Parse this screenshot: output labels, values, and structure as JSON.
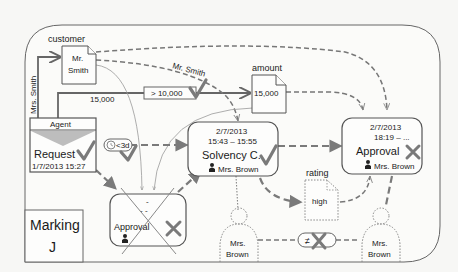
{
  "diagram": {
    "title_marking": "Marking",
    "marking_value": "J",
    "colors": {
      "stroke": "#555555",
      "mark": "#7a7a7a",
      "background": "#f7f7f5"
    },
    "data_objects": {
      "customer": {
        "label": "customer",
        "value_line1": "Mr.",
        "value_line2": "Smith"
      },
      "amount": {
        "label": "amount",
        "value": "15,000"
      },
      "rating": {
        "label": "rating",
        "value": "high"
      }
    },
    "edge_labels": {
      "mrs_smith": "Mrs. Smith",
      "mr_smith": "Mr. Smith",
      "amount_15000": "15,000",
      "condition": "> 10,000",
      "timer": "<3d"
    },
    "activities": {
      "request": {
        "role": "Agent",
        "name": "Request",
        "timestamp": "1/7/2013 15:27",
        "status": "check"
      },
      "solvency": {
        "date": "2/7/2013",
        "time": "15:43 – 15:55",
        "name": "Solvency C.",
        "performer": "Mrs. Brown",
        "status": "check"
      },
      "approval_right": {
        "date": "2/7/2013",
        "time": "18:19 – ...",
        "name": "Approval",
        "performer": "Mrs. Brown",
        "status": "cross"
      },
      "approval_left": {
        "date": "-",
        "time": "- -",
        "name": "Approval",
        "performer": "",
        "status": "cross",
        "struck_out": true
      }
    },
    "persons": [
      {
        "name_line1": "Mrs.",
        "name_line2": "Brown"
      },
      {
        "name_line1": "Mrs.",
        "name_line2": "Brown"
      }
    ],
    "constraint": {
      "symbol": "≠",
      "status": "cross"
    }
  }
}
